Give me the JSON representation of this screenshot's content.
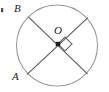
{
  "figure": {
    "type": "circle-with-intersecting-chords",
    "background_color": "#ffffff",
    "stroke_color": "#6e6e6e",
    "label_color": "#1b1b1b",
    "labels": {
      "center": "O",
      "upper_left": "B",
      "lower_left": "A"
    },
    "circle": {
      "center_x": 57,
      "center_y": 45.5,
      "radius": 40.5
    },
    "center_point": {
      "x": 58,
      "y": 44,
      "marker": "filled-square-dot"
    },
    "chords": [
      {
        "name": "chord-B-to-lower-right",
        "x1": 28.5,
        "y1": 17.0,
        "x2": 87.5,
        "y2": 74.0
      },
      {
        "name": "chord-A-to-upper-right",
        "x1": 27.0,
        "y1": 74.5,
        "x2": 88.0,
        "y2": 17.5
      }
    ],
    "right_angle_marker": {
      "name": "right-angle-square",
      "orientation": "diamond",
      "points": "58,44 65,37 72,44 65,51"
    },
    "edge_tick": {
      "name": "left-edge-tick",
      "x": 1,
      "y": 8,
      "width": 2,
      "height": 4,
      "color": "#4a4a4a"
    }
  }
}
